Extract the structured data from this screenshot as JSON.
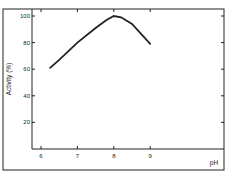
{
  "chart_data": {
    "type": "line",
    "title": "",
    "xlabel": "pH",
    "ylabel": "Activity (%)",
    "xlim": [
      5.75,
      10.2
    ],
    "ylim": [
      0,
      105
    ],
    "x_ticks": [
      "6",
      "7",
      "8",
      "9"
    ],
    "y_ticks": [
      "20",
      "40",
      "60",
      "80",
      "100"
    ],
    "grid": false,
    "legend": null,
    "series": [
      {
        "name": "Activity",
        "x": [
          6.25,
          6.5,
          7.0,
          7.5,
          7.8,
          8.0,
          8.2,
          8.5,
          9.0
        ],
        "y": [
          61,
          67,
          80,
          91,
          97,
          100,
          99,
          94,
          79
        ]
      }
    ]
  }
}
